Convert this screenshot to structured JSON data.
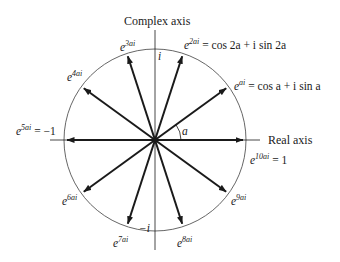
{
  "figure": {
    "axes": {
      "vertical_label": "Complex axis",
      "horizontal_label": "Real axis",
      "top_tick": "i",
      "bottom_tick": "−i",
      "angle_label": "a"
    },
    "colors": {
      "ink": "#1a1a1a",
      "circle": "#555555",
      "background": "#ffffff"
    },
    "roots": [
      {
        "k": 1,
        "base": "e",
        "exp": "ai",
        "rhs": "= cos a + i sin a"
      },
      {
        "k": 2,
        "base": "e",
        "exp": "2ai",
        "rhs": "= cos 2a + i sin 2a"
      },
      {
        "k": 3,
        "base": "e",
        "exp": "3ai",
        "rhs": ""
      },
      {
        "k": 4,
        "base": "e",
        "exp": "4ai",
        "rhs": ""
      },
      {
        "k": 5,
        "base": "e",
        "exp": "5ai",
        "rhs": "= −1"
      },
      {
        "k": 6,
        "base": "e",
        "exp": "6ai",
        "rhs": ""
      },
      {
        "k": 7,
        "base": "e",
        "exp": "7ai",
        "rhs": ""
      },
      {
        "k": 8,
        "base": "e",
        "exp": "8ai",
        "rhs": ""
      },
      {
        "k": 9,
        "base": "e",
        "exp": "9ai",
        "rhs": ""
      },
      {
        "k": 10,
        "base": "e",
        "exp": "10ai",
        "rhs": "= 1"
      }
    ],
    "geometry": {
      "center_x": 155,
      "center_y": 140,
      "radius": 91,
      "angle_step_deg": 36
    }
  }
}
